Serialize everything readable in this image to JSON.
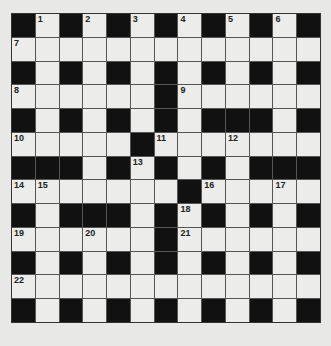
{
  "puzzle": {
    "rows": 13,
    "cols": 13,
    "grid": [
      "B.B.B.B.B.B.B",
      ".............",
      "B.B.B.B.B.B.B",
      "......#......",
      "B.B.B.B.BBB.B",
      ".....B.......",
      "BBB.B.B.B.BBB",
      ".......B.....",
      "B.BBB.B.B.B.B",
      "......B......",
      "B.B.B.B.B.B.B",
      ".............",
      "B.B.B.B.B.B.B"
    ],
    "numbers": [
      {
        "row": 0,
        "col": 1,
        "n": "1"
      },
      {
        "row": 0,
        "col": 3,
        "n": "2"
      },
      {
        "row": 0,
        "col": 5,
        "n": "3"
      },
      {
        "row": 0,
        "col": 7,
        "n": "4"
      },
      {
        "row": 0,
        "col": 9,
        "n": "5"
      },
      {
        "row": 0,
        "col": 11,
        "n": "6"
      },
      {
        "row": 1,
        "col": 0,
        "n": "7"
      },
      {
        "row": 3,
        "col": 0,
        "n": "8"
      },
      {
        "row": 3,
        "col": 7,
        "n": "9"
      },
      {
        "row": 5,
        "col": 0,
        "n": "10"
      },
      {
        "row": 5,
        "col": 6,
        "n": "11"
      },
      {
        "row": 5,
        "col": 9,
        "n": "12"
      },
      {
        "row": 6,
        "col": 5,
        "n": "13"
      },
      {
        "row": 7,
        "col": 0,
        "n": "14"
      },
      {
        "row": 7,
        "col": 1,
        "n": "15"
      },
      {
        "row": 7,
        "col": 8,
        "n": "16"
      },
      {
        "row": 7,
        "col": 11,
        "n": "17"
      },
      {
        "row": 8,
        "col": 7,
        "n": "18"
      },
      {
        "row": 9,
        "col": 0,
        "n": "19"
      },
      {
        "row": 9,
        "col": 3,
        "n": "20"
      },
      {
        "row": 9,
        "col": 7,
        "n": "21"
      },
      {
        "row": 11,
        "col": 0,
        "n": "22"
      }
    ]
  },
  "colors": {
    "background": "#e8e8e6",
    "white_cell": "#ececea",
    "black_cell": "#111111",
    "grid_line": "#555555"
  }
}
